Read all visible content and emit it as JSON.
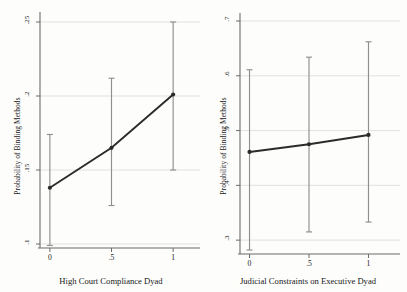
{
  "figure": {
    "background": "#fdfdfc",
    "series_color": "#2b2b2b",
    "ci_color": "#8f8f8f",
    "grid_color": "#d9d9d9",
    "axis_color": "#6b6b6b"
  },
  "chart_data": [
    {
      "type": "line",
      "panel": "left",
      "title": "",
      "xlabel": "High Court Compliance Dyad",
      "ylabel": "Probability of Binding Methods",
      "x": [
        0,
        0.5,
        1
      ],
      "xticklabels": [
        "0",
        ".5",
        "1"
      ],
      "xlim": [
        -0.08,
        1.08
      ],
      "values": [
        0.138,
        0.165,
        0.201
      ],
      "ci_low": [
        0.099,
        0.126,
        0.15
      ],
      "ci_high": [
        0.174,
        0.212,
        0.25
      ],
      "yticks": [
        0.1,
        0.15,
        0.2,
        0.25
      ],
      "yticklabels": [
        ".1",
        ".15",
        ".2",
        ".25"
      ],
      "ylim": [
        0.1,
        0.25
      ],
      "grid": true,
      "legend": "none",
      "marker": "circle"
    },
    {
      "type": "line",
      "panel": "right",
      "title": "",
      "xlabel": "Judicial Constraints on Executive Dyad",
      "ylabel": "Probability of Binding Methods",
      "x": [
        0,
        0.5,
        1
      ],
      "xticklabels": [
        "0",
        ".5",
        "1"
      ],
      "xlim": [
        -0.08,
        1.08
      ],
      "values": [
        0.461,
        0.475,
        0.492
      ],
      "ci_low": [
        0.282,
        0.315,
        0.333
      ],
      "ci_high": [
        0.611,
        0.634,
        0.662
      ],
      "yticks": [
        0.3,
        0.4,
        0.5,
        0.6,
        0.7
      ],
      "yticklabels": [
        ".3",
        ".4",
        ".5",
        ".6",
        ".7"
      ],
      "ylim": [
        0.282,
        0.7
      ],
      "grid": true,
      "legend": "none",
      "marker": "circle"
    }
  ]
}
